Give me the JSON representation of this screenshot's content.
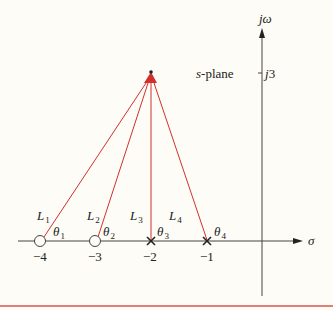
{
  "diagram": {
    "plane_label": "s-plane",
    "axes": {
      "real_label": "σ",
      "imag_label": "jω",
      "imag_tick_label": "j3",
      "real_ticks": [
        "−4",
        "−3",
        "−2",
        "−1"
      ]
    },
    "test_point": {
      "real": -2,
      "imag": 3
    },
    "zeros": [
      {
        "at": -4
      },
      {
        "at": -3
      }
    ],
    "poles": [
      {
        "at": -2
      },
      {
        "at": -1
      }
    ],
    "vectors": [
      {
        "length_label": "L",
        "length_sub": "1",
        "angle_label": "θ",
        "angle_sub": "1",
        "from": -4
      },
      {
        "length_label": "L",
        "length_sub": "2",
        "angle_label": "θ",
        "angle_sub": "2",
        "from": -3
      },
      {
        "length_label": "L",
        "length_sub": "3",
        "angle_label": "θ",
        "angle_sub": "3",
        "from": -2
      },
      {
        "length_label": "L",
        "length_sub": "4",
        "angle_label": "θ",
        "angle_sub": "4",
        "from": -1
      }
    ],
    "colors": {
      "vector": "#d0312d",
      "axis": "#333333",
      "rule": "#d9534f",
      "background": "#fdfcf6"
    }
  }
}
